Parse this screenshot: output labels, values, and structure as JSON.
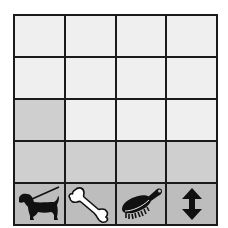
{
  "board": {
    "columns": 4,
    "rows": 5,
    "colors": {
      "light": "#efefef",
      "gray": "#cfcfcf",
      "icon_row": "#bdbdbd",
      "grid_line": "#1a1a1a"
    },
    "cells": [
      [
        "light",
        "light",
        "light",
        "light"
      ],
      [
        "light",
        "light",
        "light",
        "light"
      ],
      [
        "gray",
        "light",
        "light",
        "light"
      ],
      [
        "gray",
        "gray",
        "gray",
        "gray"
      ]
    ],
    "icons": [
      {
        "name": "dog-on-leash-icon",
        "label": "dog"
      },
      {
        "name": "bone-icon",
        "label": "bone"
      },
      {
        "name": "brush-icon",
        "label": "brush"
      },
      {
        "name": "up-down-arrow-icon",
        "label": "move"
      }
    ]
  }
}
